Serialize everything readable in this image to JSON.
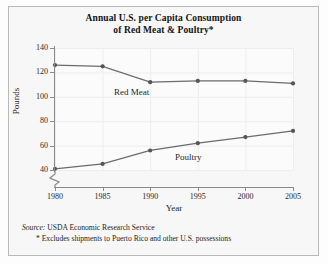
{
  "title": {
    "line1": "Annual U.S. per Capita Consumption",
    "line2": "of Red Meat & Poultry*"
  },
  "footnotes": {
    "source_word": "Source:",
    "source_text": " USDA Economic Research Service",
    "asterisk_note": "* Excludes shipments to Puerto Rico and other U.S. possessions"
  },
  "colors": {
    "line": "#6b6b6b",
    "marker": "#555555",
    "grid": "#ededed",
    "axis": "#8a8a8a",
    "text": "#1d1d1d",
    "frame": "#b9b9b9",
    "background": "#f7f7f7"
  },
  "chart_data": {
    "type": "line",
    "title": "Annual U.S. per Capita Consumption of Red Meat & Poultry*",
    "xlabel": "Year",
    "ylabel": "Pounds",
    "x": [
      1980,
      1985,
      1990,
      1995,
      2000,
      2005
    ],
    "xtick_labels": [
      "1980",
      "1985",
      "1990",
      "1995",
      "2000",
      "2005"
    ],
    "ytick_labels": [
      "40",
      "60",
      "80",
      "100",
      "120",
      "140"
    ],
    "yticks": [
      40,
      60,
      80,
      100,
      120,
      140
    ],
    "ylim": [
      40,
      140
    ],
    "xlim": [
      1980,
      2005
    ],
    "y_axis_break": true,
    "grid": true,
    "legend": "inline-labels",
    "series": [
      {
        "name": "Red Meat",
        "label_x": 1986.2,
        "label_y": 104,
        "values": [
          126,
          125,
          112,
          113,
          113,
          111
        ]
      },
      {
        "name": "Poultry",
        "label_x": 1992.6,
        "label_y": 51,
        "values": [
          41,
          45,
          56,
          62,
          67,
          72
        ]
      }
    ]
  }
}
